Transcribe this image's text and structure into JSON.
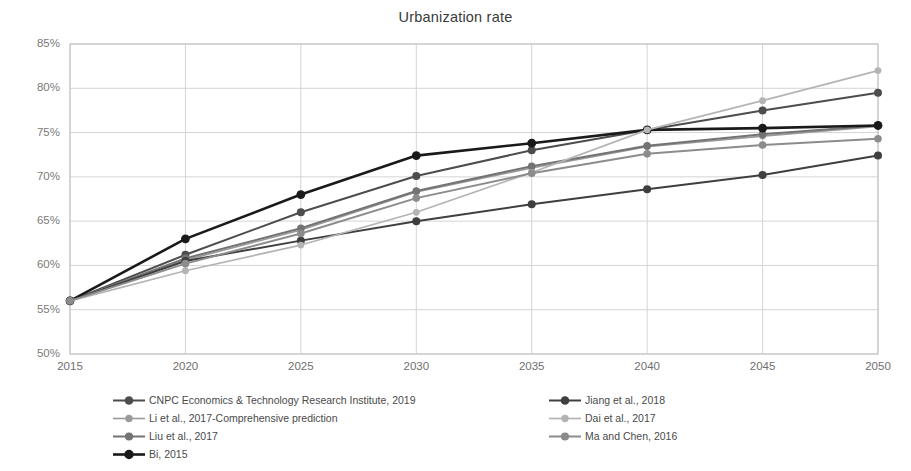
{
  "chart_data": {
    "type": "line",
    "title": "Urbanization rate",
    "xlabel": "",
    "ylabel": "",
    "x": [
      2015,
      2020,
      2025,
      2030,
      2035,
      2040,
      2045,
      2050
    ],
    "categories": [
      "2015",
      "2020",
      "2025",
      "2030",
      "2035",
      "2040",
      "2045",
      "2050"
    ],
    "xlim": [
      2015,
      2050
    ],
    "ylim": [
      50,
      85
    ],
    "ytick_labels": [
      "85%",
      "80%",
      "75%",
      "70%",
      "65%",
      "60%",
      "55%",
      "50%"
    ],
    "ytick_values": [
      85,
      80,
      75,
      70,
      65,
      60,
      55,
      50
    ],
    "yunit": "%",
    "grid": true,
    "legend_position": "bottom",
    "series": [
      {
        "name": "CNPC Economics & Technology Research Institute, 2019",
        "color": "#4d4d4d",
        "width": 2.0,
        "marker": 4.0,
        "values": [
          56.0,
          61.2,
          66.0,
          70.1,
          73.0,
          75.3,
          77.5,
          79.5
        ]
      },
      {
        "name": "Li et al., 2017-Comprehensive prediction",
        "color": "#9a9a9a",
        "width": 1.6,
        "marker": 3.4,
        "values": [
          56.0,
          60.6,
          64.0,
          68.3,
          71.0,
          73.4,
          74.6,
          75.7
        ]
      },
      {
        "name": "Liu et al., 2017",
        "color": "#737373",
        "width": 2.0,
        "marker": 3.8,
        "values": [
          56.0,
          60.8,
          64.2,
          68.4,
          71.2,
          73.5,
          74.8,
          75.8
        ]
      },
      {
        "name": "Bi, 2015",
        "color": "#1a1a1a",
        "width": 2.6,
        "marker": 4.4,
        "values": [
          56.0,
          63.0,
          68.0,
          72.4,
          73.8,
          75.3,
          75.5,
          75.8
        ]
      },
      {
        "name": "Jiang et al., 2018",
        "color": "#3f3f3f",
        "width": 2.0,
        "marker": 4.0,
        "values": [
          56.0,
          60.5,
          62.8,
          65.0,
          66.9,
          68.6,
          70.2,
          72.4
        ]
      },
      {
        "name": "Dai et al., 2017",
        "color": "#b4b4b4",
        "width": 1.7,
        "marker": 3.4,
        "values": [
          56.0,
          59.4,
          62.3,
          66.0,
          70.5,
          75.3,
          78.6,
          82.0
        ]
      },
      {
        "name": "Ma and Chen, 2016",
        "color": "#8c8c8c",
        "width": 2.0,
        "marker": 3.8,
        "values": [
          56.0,
          60.2,
          63.6,
          67.6,
          70.4,
          72.6,
          73.6,
          74.3
        ]
      }
    ]
  },
  "axis_colors": {
    "grid": "#d4d4d4",
    "frame": "#c0c0c0",
    "tick_text": "#7b7b7b"
  }
}
